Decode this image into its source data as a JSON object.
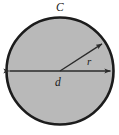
{
  "figure": {
    "type": "geometry-diagram",
    "background_color": "#ffffff",
    "circle": {
      "name": "circle",
      "fill_color": "#b9b9b9",
      "stroke_color": "#1c1c1c",
      "stroke_width": 2.6,
      "center_x": 60,
      "center_y": 71,
      "radius": 53.5
    },
    "labels": {
      "circumference": "C",
      "radius": "r",
      "diameter": "d"
    },
    "label_positions": {
      "circumference": {
        "x": 56,
        "y": 11
      },
      "radius": {
        "x": 87,
        "y": 65
      },
      "diameter": {
        "x": 55,
        "y": 86
      }
    },
    "diameter_arrow": {
      "name": "diameter-arrow",
      "x1": 8.5,
      "y1": 71,
      "x2": 111.5,
      "y2": 71,
      "color": "#2b2b2b",
      "stroke_width": 1.4,
      "double_headed": true
    },
    "radius_arrow": {
      "name": "radius-arrow",
      "x1": 60,
      "y1": 71,
      "x2": 103,
      "y2": 43,
      "color": "#2b2b2b",
      "stroke_width": 1.4,
      "double_headed": false
    },
    "center_dot": {
      "x": 60,
      "y": 71
    }
  }
}
